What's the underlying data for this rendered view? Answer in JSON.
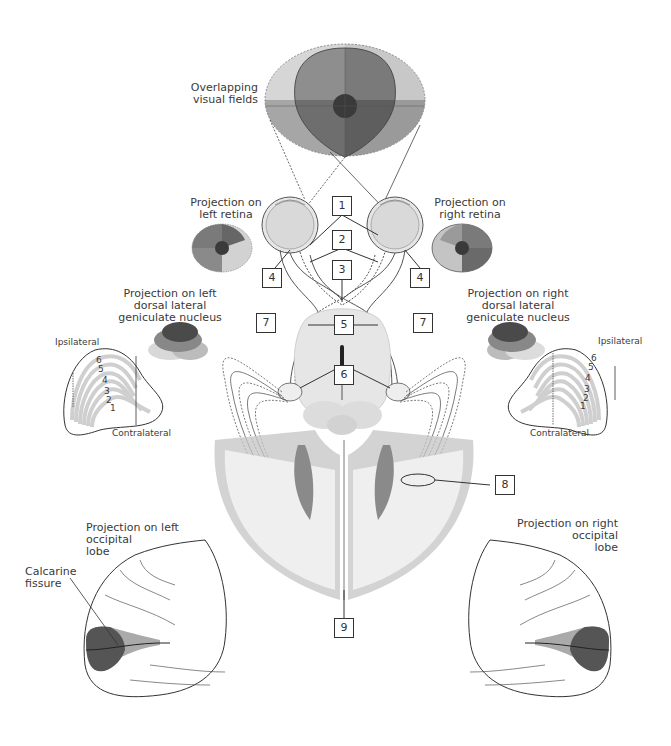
{
  "title_labels": {
    "overlapping_visual_fields": [
      "Overlapping",
      "visual fields"
    ],
    "left_retina": [
      "Projection on",
      "left retina"
    ],
    "right_retina": [
      "Projection on",
      "right retina"
    ],
    "left_lgn": [
      "Projection on left",
      "dorsal lateral",
      "geniculate nucleus"
    ],
    "right_lgn": [
      "Projection on right",
      "dorsal lateral",
      "geniculate nucleus"
    ],
    "left_occipital": [
      "Projection on left",
      "occipital",
      "lobe"
    ],
    "right_occipital": [
      "Projection on right",
      "occipital",
      "lobe"
    ],
    "calcarine": [
      "Calcarine",
      "fissure"
    ]
  },
  "lgn_labels": {
    "ipsilateral": "Ipsilateral",
    "contralateral": "Contralateral",
    "layers": [
      "1",
      "2",
      "3",
      "4",
      "5",
      "6"
    ]
  },
  "callouts": [
    "1",
    "2",
    "3",
    "4",
    "4",
    "5",
    "6",
    "7",
    "7",
    "8",
    "9"
  ],
  "colors": {
    "quadrant_dark": "#5c5c5c",
    "quadrant_mid": "#8a8a8a",
    "quadrant_light": "#c4c4c4",
    "quadrant_lighter": "#dedede",
    "fovea": "#2e2e2e",
    "cortex_gray": "#b8b8b8",
    "line": "#333333"
  }
}
